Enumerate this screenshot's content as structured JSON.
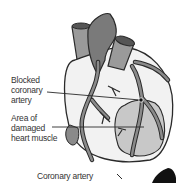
{
  "diagram": {
    "subject": "heart",
    "labels": {
      "blocked_artery": [
        "Blocked",
        "coronary",
        "artery"
      ],
      "damaged_area": [
        "Area of",
        "damaged",
        "heart muscle"
      ],
      "coronary_artery": "Coronary artery"
    },
    "colors": {
      "outline": "#2a2a2a",
      "heart_body": "#f2f2f2",
      "vessel_dark": "#7a7a7a",
      "vessel_mid": "#9a9a9a",
      "damaged_area": "#c8c8c8",
      "blockage_dot": "#111111"
    }
  }
}
